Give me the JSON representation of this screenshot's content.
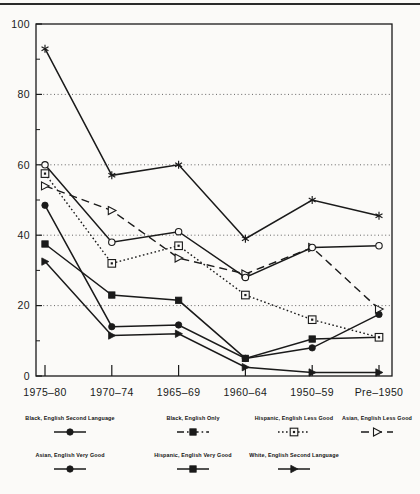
{
  "chart_data": {
    "type": "line",
    "title": "",
    "subtitle": "",
    "xlabel": "",
    "ylabel": "",
    "categories": [
      "1975–80",
      "1970–74",
      "1965–69",
      "1960–64",
      "1950–59",
      "Pre–1950"
    ],
    "ylim": [
      0,
      100
    ],
    "yticks": [
      0,
      20,
      40,
      60,
      80,
      100
    ],
    "yticklabels": [
      "0",
      "20",
      "40",
      "60",
      "80",
      "100"
    ],
    "minor_yticks": [
      10,
      30,
      50,
      70,
      90
    ],
    "grid": "horizontal-dotted-at-20-40-60-80",
    "legend_position": "below-axes",
    "series": [
      {
        "name": "Black, English Second Language",
        "marker": "filled-circle",
        "line": "solid",
        "values": [
          48.5,
          14,
          14.5,
          5,
          8,
          17.5
        ]
      },
      {
        "name": "Black, English Only",
        "marker": "filled-square",
        "line": "solid",
        "values": [
          37.5,
          23,
          21.5,
          5,
          10.5,
          11
        ]
      },
      {
        "name": "Hispanic, English Less Good",
        "marker": "open-square",
        "line": "dotted",
        "values": [
          57.5,
          32,
          37,
          23,
          16,
          11
        ]
      },
      {
        "name": "Asian, English Less Good",
        "marker": "open-triangle-right",
        "line": "dashed",
        "values": [
          54,
          47,
          33.5,
          29,
          36.5,
          19
        ]
      },
      {
        "name": "Asian, English Very Good",
        "marker": "open-circle",
        "line": "solid",
        "values": [
          60,
          38,
          41,
          28,
          36.5,
          37
        ]
      },
      {
        "name": "Hispanic, English Very Good",
        "marker": "filled-triangle-right",
        "line": "solid",
        "values": [
          32.5,
          11.5,
          12,
          2.5,
          1,
          1
        ]
      },
      {
        "name": "White, English Second Language",
        "marker": "asterisk",
        "line": "solid",
        "values": [
          93,
          57,
          60,
          39,
          50,
          45.5
        ]
      }
    ]
  },
  "axes": {
    "yticklabels": [
      "100",
      "80",
      "60",
      "40",
      "20",
      "0"
    ],
    "xticklabels": [
      "1975–80",
      "1970–74",
      "1965–69",
      "1960–64",
      "1950–59",
      "Pre–1950"
    ]
  },
  "legend": {
    "row1": [
      {
        "label": "Black, English Second Language",
        "marker": "filled-circle",
        "line": "solid"
      },
      {
        "label": "Black, English Only",
        "marker": "filled-square",
        "line": "dashdot"
      },
      {
        "label": "Hispanic, English Less Good",
        "marker": "open-square",
        "line": "dotted"
      },
      {
        "label": "Asian, English Less Good",
        "marker": "open-triangle-right",
        "line": "dashed"
      }
    ],
    "row2": [
      {
        "label": "Asian, English Very Good",
        "marker": "filled-circle",
        "line": "solid"
      },
      {
        "label": "Hispanic, English Very Good",
        "marker": "filled-square",
        "line": "solid"
      },
      {
        "label": "White, English Second Language",
        "marker": "filled-triangle-right",
        "line": "solid"
      }
    ]
  },
  "colors": {
    "ink": "#1a1a1a",
    "paper": "#fbfaf8",
    "grid": "#555555"
  }
}
